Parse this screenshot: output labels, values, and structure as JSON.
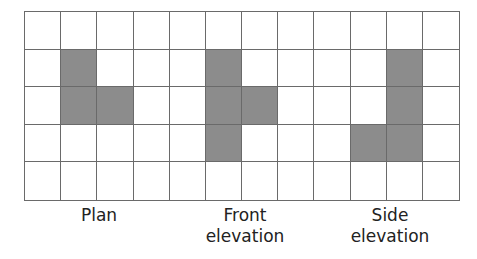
{
  "diagram": {
    "grid": {
      "columns": 12,
      "rows": 5
    },
    "colors": {
      "shaded": "#8c8c8c",
      "empty": "#ffffff",
      "lines": "#6a6a6a"
    },
    "views": [
      {
        "name": "Plan",
        "label_line1": "Plan",
        "label_line2": "",
        "shaded_cells": [
          [
            1,
            1
          ],
          [
            1,
            2
          ],
          [
            2,
            2
          ]
        ],
        "label_center_x": 99
      },
      {
        "name": "Front elevation",
        "label_line1": "Front",
        "label_line2": "elevation",
        "shaded_cells": [
          [
            5,
            1
          ],
          [
            5,
            2
          ],
          [
            6,
            2
          ],
          [
            5,
            3
          ]
        ],
        "label_center_x": 245
      },
      {
        "name": "Side elevation",
        "label_line1": "Side",
        "label_line2": "elevation",
        "shaded_cells": [
          [
            10,
            1
          ],
          [
            10,
            2
          ],
          [
            9,
            3
          ],
          [
            10,
            3
          ]
        ],
        "label_center_x": 390
      }
    ]
  }
}
